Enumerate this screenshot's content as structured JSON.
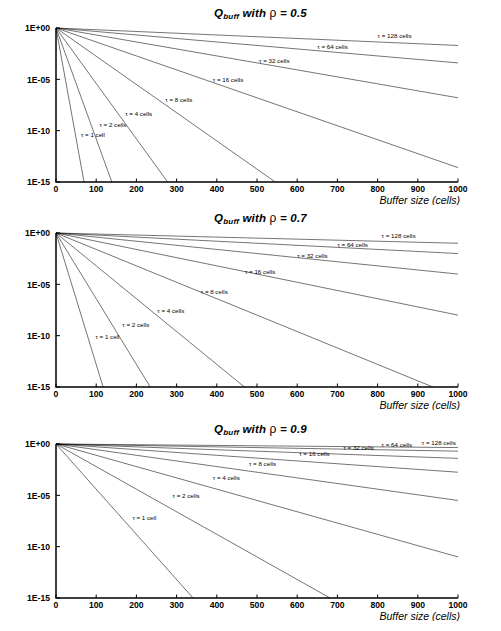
{
  "figure": {
    "axis_title_x": "Buffer size (cells)",
    "geometry": {
      "plot_left": 56,
      "plot_right": 458,
      "plot_top": 28,
      "plot_bottom": 182,
      "panel_height": 205
    }
  },
  "chart_data": [
    {
      "type": "line",
      "title": "Q_buff with ρ = 0.5",
      "title_prefix": "Q",
      "title_sub": "buff",
      "title_mid": " with ",
      "title_rho": "ρ",
      "title_value": " = 0.5",
      "rho": 0.5,
      "xlabel": "Buffer size (cells)",
      "ylabel": "",
      "xlim": [
        0,
        1000
      ],
      "ylim": [
        1e-15,
        1
      ],
      "xticks": [
        0,
        100,
        200,
        300,
        400,
        500,
        600,
        700,
        800,
        900,
        1000
      ],
      "xticklabels": [
        "0",
        "100",
        "200",
        "300",
        "400",
        "500",
        "600",
        "700",
        "800",
        "900",
        "1000"
      ],
      "yticks": [
        1,
        1e-05,
        1e-10,
        1e-15
      ],
      "yticklabels": [
        "1E+00",
        "1E-05",
        "1E-10",
        "1E-15"
      ],
      "grid": false,
      "legend": "inline-curve-labels",
      "series": [
        {
          "name": "τ = 1 cell",
          "tau": 1,
          "decay_decades_per_1000": 215,
          "label_x": 62,
          "label_y": -10.6
        },
        {
          "name": "τ = 2 cells",
          "tau": 2,
          "decay_decades_per_1000": 108,
          "label_x": 108,
          "label_y": -9.6
        },
        {
          "name": "τ = 4 cells",
          "tau": 4,
          "decay_decades_per_1000": 54,
          "label_x": 172,
          "label_y": -8.6
        },
        {
          "name": "τ = 8 cells",
          "tau": 8,
          "decay_decades_per_1000": 27.5,
          "label_x": 272,
          "label_y": -7.2
        },
        {
          "name": "τ = 16 cells",
          "tau": 16,
          "decay_decades_per_1000": 13.6,
          "label_x": 390,
          "label_y": -5.3
        },
        {
          "name": "τ = 32 cells",
          "tau": 32,
          "decay_decades_per_1000": 6.8,
          "label_x": 505,
          "label_y": -3.4
        },
        {
          "name": "τ = 64 cells",
          "tau": 64,
          "decay_decades_per_1000": 3.4,
          "label_x": 650,
          "label_y": -2.0
        },
        {
          "name": "τ = 128 cells",
          "tau": 128,
          "decay_decades_per_1000": 1.7,
          "label_x": 800,
          "label_y": -0.95
        }
      ]
    },
    {
      "type": "line",
      "title": "Q_buff with ρ = 0.7",
      "title_prefix": "Q",
      "title_sub": "buff",
      "title_mid": " with ",
      "title_rho": "ρ",
      "title_value": " = 0.7",
      "rho": 0.7,
      "xlabel": "Buffer size (cells)",
      "ylabel": "",
      "xlim": [
        0,
        1000
      ],
      "ylim": [
        1e-15,
        1
      ],
      "xticks": [
        0,
        100,
        200,
        300,
        400,
        500,
        600,
        700,
        800,
        900,
        1000
      ],
      "xticklabels": [
        "0",
        "100",
        "200",
        "300",
        "400",
        "500",
        "600",
        "700",
        "800",
        "900",
        "1000"
      ],
      "yticks": [
        1,
        1e-05,
        1e-10,
        1e-15
      ],
      "yticklabels": [
        "1E+00",
        "1E-05",
        "1E-10",
        "1E-15"
      ],
      "grid": false,
      "legend": "inline-curve-labels",
      "series": [
        {
          "name": "τ = 1 cell",
          "tau": 1,
          "decay_decades_per_1000": 128,
          "label_x": 98,
          "label_y": -10.3
        },
        {
          "name": "τ = 2 cells",
          "tau": 2,
          "decay_decades_per_1000": 64,
          "label_x": 165,
          "label_y": -9.2
        },
        {
          "name": "τ = 4 cells",
          "tau": 4,
          "decay_decades_per_1000": 32,
          "label_x": 252,
          "label_y": -7.8
        },
        {
          "name": "τ = 8 cells",
          "tau": 8,
          "decay_decades_per_1000": 16,
          "label_x": 360,
          "label_y": -5.9
        },
        {
          "name": "τ = 16 cells",
          "tau": 16,
          "decay_decades_per_1000": 8,
          "label_x": 470,
          "label_y": -4.0
        },
        {
          "name": "τ = 32 cells",
          "tau": 32,
          "decay_decades_per_1000": 4,
          "label_x": 600,
          "label_y": -2.4
        },
        {
          "name": "τ = 64 cells",
          "tau": 64,
          "decay_decades_per_1000": 2,
          "label_x": 700,
          "label_y": -1.35
        },
        {
          "name": "τ = 128 cells",
          "tau": 128,
          "decay_decades_per_1000": 1.0,
          "label_x": 810,
          "label_y": -0.45
        }
      ]
    },
    {
      "type": "line",
      "title": "Q_buff with ρ = 0.9",
      "title_prefix": "Q",
      "title_sub": "buff",
      "title_mid": " with ",
      "title_rho": "ρ",
      "title_value": " = 0.9",
      "rho": 0.9,
      "xlabel": "Buffer size (cells)",
      "ylabel": "",
      "xlim": [
        0,
        1000
      ],
      "ylim": [
        1e-15,
        1
      ],
      "xticks": [
        0,
        100,
        200,
        300,
        400,
        500,
        600,
        700,
        800,
        900,
        1000
      ],
      "xticklabels": [
        "0",
        "100",
        "200",
        "300",
        "400",
        "500",
        "600",
        "700",
        "800",
        "900",
        "1000"
      ],
      "yticks": [
        1,
        1e-05,
        1e-10,
        1e-15
      ],
      "yticklabels": [
        "1E+00",
        "1E-05",
        "1E-10",
        "1E-15"
      ],
      "grid": false,
      "legend": "inline-curve-labels",
      "series": [
        {
          "name": "τ = 1 cell",
          "tau": 1,
          "decay_decades_per_1000": 44,
          "label_x": 190,
          "label_y": -7.4
        },
        {
          "name": "τ = 2 cells",
          "tau": 2,
          "decay_decades_per_1000": 22,
          "label_x": 290,
          "label_y": -5.3
        },
        {
          "name": "τ = 4 cells",
          "tau": 4,
          "decay_decades_per_1000": 11,
          "label_x": 390,
          "label_y": -3.5
        },
        {
          "name": "τ = 8 cells",
          "tau": 8,
          "decay_decades_per_1000": 5.5,
          "label_x": 480,
          "label_y": -2.1
        },
        {
          "name": "τ = 16 cells",
          "tau": 16,
          "decay_decades_per_1000": 2.75,
          "label_x": 605,
          "label_y": -1.15
        },
        {
          "name": "τ = 32 cells",
          "tau": 32,
          "decay_decades_per_1000": 1.4,
          "label_x": 715,
          "label_y": -0.62
        },
        {
          "name": "τ = 64 cells",
          "tau": 64,
          "decay_decades_per_1000": 0.7,
          "label_x": 810,
          "label_y": -0.3
        },
        {
          "name": "τ = 128 cells",
          "tau": 128,
          "decay_decades_per_1000": 0.35,
          "label_x": 910,
          "label_y": -0.12
        }
      ]
    }
  ]
}
